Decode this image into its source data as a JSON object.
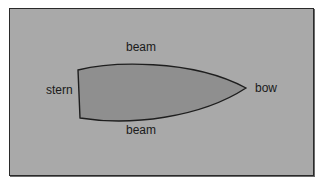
{
  "diagram": {
    "title": "",
    "labels": {
      "beam_top": "beam",
      "beam_bottom": "beam",
      "stern": "stern",
      "bow": "bow"
    },
    "colors": {
      "background": "#a9a9a9",
      "hull_fill": "#8f8f8f",
      "outline": "#1e1e1e",
      "text": "#1a1a1a"
    }
  }
}
